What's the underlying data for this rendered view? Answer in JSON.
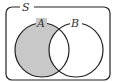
{
  "diagram": {
    "type": "venn",
    "universe_label": "S",
    "sets": [
      {
        "label": "A",
        "cx": 42,
        "cy": 50,
        "r": 27
      },
      {
        "label": "B",
        "cx": 76,
        "cy": 50,
        "r": 27
      }
    ],
    "shaded_region": "A minus B",
    "colors": {
      "stroke": "#222222",
      "shade": "#c8c8c8",
      "background": "#ffffff"
    }
  }
}
